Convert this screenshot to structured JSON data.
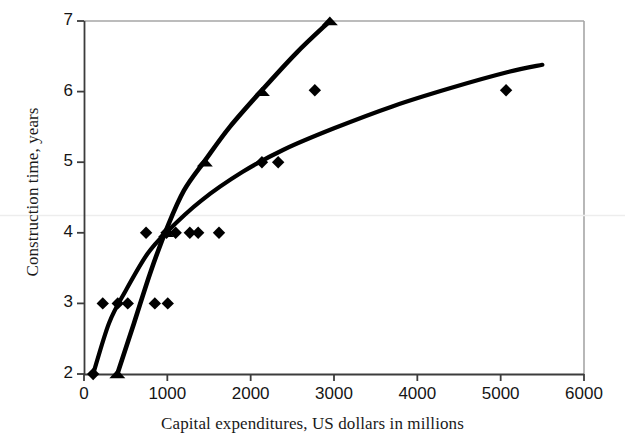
{
  "chart_data": {
    "type": "scatter",
    "title": "",
    "xlabel": "Capital expenditures, US dollars in millions",
    "ylabel": "Construction time, years",
    "xlim": [
      0,
      6000
    ],
    "ylim": [
      2,
      7
    ],
    "xticks": [
      0,
      1000,
      2000,
      3000,
      4000,
      5000,
      6000
    ],
    "yticks": [
      2,
      3,
      4,
      5,
      6,
      7
    ],
    "xtick_labels": [
      "0",
      "1000",
      "2000",
      "3000",
      "4000",
      "5000",
      "6000"
    ],
    "ytick_labels": [
      "2",
      "3",
      "4",
      "5",
      "6",
      "7"
    ],
    "grid": false,
    "legend": "none",
    "series": [
      {
        "name": "diamond-series",
        "marker": "diamond",
        "color": "#000000",
        "points": [
          [
            110,
            2.0
          ],
          [
            225,
            3.0
          ],
          [
            405,
            3.0
          ],
          [
            525,
            3.0
          ],
          [
            850,
            3.0
          ],
          [
            1005,
            3.0
          ],
          [
            745,
            4.0
          ],
          [
            990,
            4.0
          ],
          [
            1100,
            4.0
          ],
          [
            1270,
            4.0
          ],
          [
            1370,
            4.0
          ],
          [
            1620,
            4.0
          ],
          [
            2135,
            5.0
          ],
          [
            2330,
            5.0
          ],
          [
            2770,
            6.02
          ],
          [
            5065,
            6.02
          ]
        ]
      },
      {
        "name": "triangle-series",
        "marker": "triangle",
        "color": "#000000",
        "points": [
          [
            400,
            2.0
          ],
          [
            985,
            4.0
          ],
          [
            1450,
            5.0
          ],
          [
            2135,
            6.0
          ],
          [
            2950,
            7.0
          ]
        ]
      }
    ],
    "curves": [
      {
        "name": "diamond-trend-curve",
        "color": "#000000",
        "width": 4.2,
        "path_points": [
          [
            110,
            2.0
          ],
          [
            300,
            2.72
          ],
          [
            500,
            3.18
          ],
          [
            760,
            3.7
          ],
          [
            1000,
            4.02
          ],
          [
            1400,
            4.45
          ],
          [
            1900,
            4.86
          ],
          [
            2400,
            5.18
          ],
          [
            3000,
            5.48
          ],
          [
            3700,
            5.79
          ],
          [
            4400,
            6.05
          ],
          [
            5100,
            6.28
          ],
          [
            5500,
            6.38
          ]
        ]
      },
      {
        "name": "triangle-trend-curve",
        "color": "#000000",
        "width": 4.6,
        "path_points": [
          [
            400,
            2.0
          ],
          [
            600,
            2.72
          ],
          [
            800,
            3.45
          ],
          [
            1000,
            4.08
          ],
          [
            1200,
            4.6
          ],
          [
            1450,
            5.02
          ],
          [
            1750,
            5.5
          ],
          [
            2135,
            6.02
          ],
          [
            2550,
            6.55
          ],
          [
            2950,
            7.0
          ]
        ]
      }
    ]
  },
  "axes": {
    "frame_color": "#9b9b9b",
    "axis_color": "#4a4a4a",
    "plot_bg": "#ffffff"
  }
}
